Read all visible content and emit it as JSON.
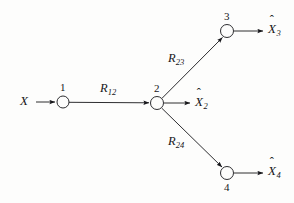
{
  "figure": {
    "type": "network-diagram",
    "background_color": "#fdfdfc",
    "line_color": "#16161a"
  },
  "source": {
    "label": "X",
    "name": "source-x"
  },
  "nodes": [
    {
      "id": "1",
      "label": "1",
      "cx": 63,
      "cy": 102,
      "r": 6,
      "label_pos": "above"
    },
    {
      "id": "2",
      "label": "2",
      "cx": 157,
      "cy": 103,
      "r": 6.5,
      "label_pos": "above"
    },
    {
      "id": "3",
      "label": "3",
      "cx": 227,
      "cy": 31,
      "r": 6.5,
      "label_pos": "above"
    },
    {
      "id": "4",
      "label": "4",
      "cx": 227,
      "cy": 173,
      "r": 6.5,
      "label_pos": "below"
    }
  ],
  "edges": [
    {
      "id": "x-to-1",
      "label": "",
      "from": "X",
      "to": "1"
    },
    {
      "id": "1-to-2",
      "label": "R",
      "sub": "12",
      "from": "1",
      "to": "2"
    },
    {
      "id": "2-to-3",
      "label": "R",
      "sub": "23",
      "from": "2",
      "to": "3"
    },
    {
      "id": "2-to-4",
      "label": "R",
      "sub": "24",
      "from": "2",
      "to": "4"
    }
  ],
  "rate_labels": [
    {
      "id": "R12",
      "base": "R",
      "sub": "12",
      "x": 100,
      "y": 82
    },
    {
      "id": "R23",
      "base": "R",
      "sub": "23",
      "x": 168,
      "y": 52
    },
    {
      "id": "R24",
      "base": "R",
      "sub": "24",
      "x": 168,
      "y": 135
    }
  ],
  "outputs": [
    {
      "id": "Xhat2",
      "base": "X",
      "hat": "ˆ",
      "sub": "2",
      "x": 195,
      "y": 96,
      "from_node": "2"
    },
    {
      "id": "Xhat3",
      "base": "X",
      "hat": "ˆ",
      "sub": "3",
      "x": 268,
      "y": 22,
      "from_node": "3"
    },
    {
      "id": "Xhat4",
      "base": "X",
      "hat": "ˆ",
      "sub": "4",
      "x": 268,
      "y": 164,
      "from_node": "4"
    }
  ],
  "source_label": {
    "text": "X",
    "x": 22,
    "y": 95
  }
}
